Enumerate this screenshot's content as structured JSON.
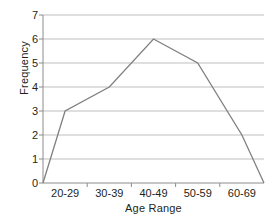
{
  "chart_data": {
    "type": "line",
    "title": "",
    "subtitle": "",
    "xlabel": "Age Range",
    "ylabel": "Frequency",
    "categories": [
      "20-29",
      "30-39",
      "40-49",
      "50-59",
      "60-69"
    ],
    "values": [
      3,
      4,
      6,
      5,
      2
    ],
    "series": [
      {
        "name": "Frequency",
        "values": [
          3,
          4,
          6,
          5,
          2
        ]
      }
    ],
    "polygon_points": [
      {
        "x": "left-anchor",
        "y": 0
      },
      {
        "x": "20-29",
        "y": 3
      },
      {
        "x": "30-39",
        "y": 4
      },
      {
        "x": "40-49",
        "y": 6
      },
      {
        "x": "50-59",
        "y": 5
      },
      {
        "x": "60-69",
        "y": 2
      },
      {
        "x": "right-anchor",
        "y": 0
      }
    ],
    "ylim": [
      0,
      7
    ],
    "ytick_labels": [
      "7",
      "6",
      "5",
      "4",
      "3",
      "2",
      "1",
      "0"
    ],
    "ytick_values": [
      7,
      6,
      5,
      4,
      3,
      2,
      1,
      0
    ],
    "grid": true,
    "grid_axis": "y",
    "legend": false,
    "legend_position": "none",
    "annotations": [],
    "colors": {
      "line": "#808080",
      "grid": "#bfbfbf",
      "axis": "#8c8c8c",
      "text": "#231f20",
      "background": "#ffffff"
    }
  }
}
